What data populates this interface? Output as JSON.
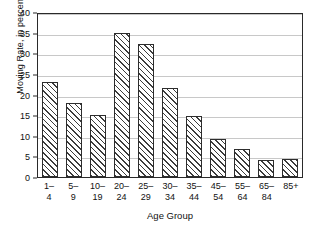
{
  "chart_data": {
    "type": "bar",
    "title": "",
    "xlabel": "Age Group",
    "ylabel": "Moving Rate, in percent",
    "categories": [
      "1–4",
      "5–9",
      "10–19",
      "20–24",
      "25–29",
      "30–34",
      "35–44",
      "45–54",
      "55–64",
      "65–84",
      "85+"
    ],
    "values": [
      23,
      18,
      15.1,
      35,
      32.3,
      21.7,
      14.8,
      9.3,
      6.8,
      4.1,
      4.4
    ],
    "ylim": [
      0,
      40
    ],
    "ytick_labels": [
      "0",
      "5",
      "10",
      "15",
      "20",
      "25",
      "30",
      "35",
      "40"
    ],
    "ytick_values": [
      0,
      5,
      10,
      15,
      20,
      25,
      30,
      35,
      40
    ],
    "grid": "horizontal",
    "legend": "none",
    "bar_fill": "diagonal-hatch",
    "bar_edge_color": "#2d2d2d",
    "gridline_color": "#c8c8c8",
    "frame_color": "#2a2a2a"
  }
}
